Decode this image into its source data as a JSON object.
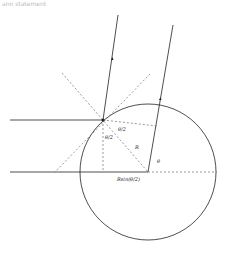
{
  "header": {
    "text": "ann statement"
  },
  "diagram": {
    "labels": {
      "half_angle_top": "θ/2",
      "half_angle_left": "θ/2",
      "radius": "R",
      "angle": "θ",
      "base": "Rsin(θ/2)"
    },
    "colors": {
      "stroke": "#222222",
      "dashed": "#555555",
      "background": "#ffffff"
    }
  }
}
